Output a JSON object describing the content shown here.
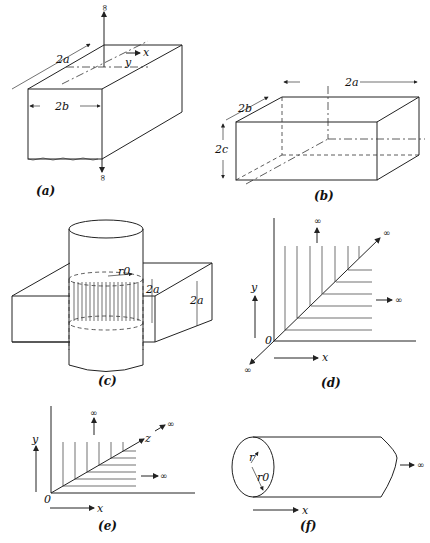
{
  "figure": {
    "panels": [
      {
        "id": "a",
        "caption": "(a)",
        "labels": {
          "width_a": "2a",
          "width_b": "2b",
          "x": "x",
          "y": "y",
          "inf_top": "∞",
          "inf_bottom": "∞"
        }
      },
      {
        "id": "b",
        "caption": "(b)",
        "labels": {
          "dim_a": "2a",
          "dim_b": "2b",
          "dim_c": "2c"
        }
      },
      {
        "id": "c",
        "caption": "(c)",
        "labels": {
          "radius": "r0",
          "height_inner": "2a",
          "height_outer": "2a"
        }
      },
      {
        "id": "d",
        "caption": "(d)",
        "labels": {
          "origin": "0",
          "x": "x",
          "y": "y",
          "inf_up": "∞",
          "inf_right": "∞",
          "inf_diag": "∞",
          "inf_down": "∞"
        }
      },
      {
        "id": "e",
        "caption": "(e)",
        "labels": {
          "origin": "0",
          "x": "x",
          "y": "y",
          "z": "z",
          "inf_up": "∞",
          "inf_right": "∞",
          "inf_diag": "∞"
        }
      },
      {
        "id": "f",
        "caption": "(f)",
        "labels": {
          "r": "r",
          "r0": "r0",
          "x": "x",
          "inf_right": "∞"
        }
      }
    ]
  }
}
